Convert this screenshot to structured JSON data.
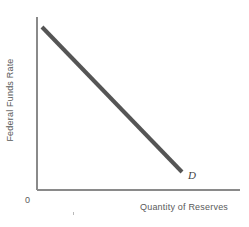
{
  "figure": {
    "background_color": "#ffffff",
    "width": 249,
    "height": 227
  },
  "axes": {
    "origin_label": "0",
    "axis_color": "#8a8a8a",
    "x_axis": {
      "start_x": 37,
      "end_x": 240,
      "y": 190
    },
    "y_axis": {
      "x": 37,
      "start_y": 17,
      "end_y": 190
    }
  },
  "labels": {
    "y_axis_title": "Federal Funds Rate",
    "x_axis_title": "Quantity of Reserves",
    "curve_label": "D",
    "text_color": "#5a5a5a"
  },
  "chart_data": {
    "type": "line",
    "title": "",
    "subtitle": "",
    "xlabel": "Quantity of Reserves",
    "ylabel": "Federal Funds Rate",
    "xlim": [
      0,
      1
    ],
    "ylim": [
      0,
      1
    ],
    "grid": false,
    "legend": "none",
    "axis_ticks": {
      "x": [],
      "y": []
    },
    "origin_tick_label": "0",
    "series": [
      {
        "name": "D",
        "label": "D",
        "description": "Downward-sloping demand curve for reserves",
        "color": "#555555",
        "linewidth": 4,
        "annotation": "D",
        "points": [
          {
            "x": 0.025,
            "y": 0.945
          },
          {
            "x": 0.715,
            "y": 0.105
          }
        ],
        "pixel_points": [
          {
            "x": 42,
            "y": 27
          },
          {
            "x": 182,
            "y": 172
          }
        ]
      }
    ],
    "annotations": [
      {
        "text": "D",
        "x": 190,
        "y": 177,
        "style": "italic"
      },
      {
        "text": "0",
        "x": 27,
        "y": 202,
        "style": "normal"
      }
    ]
  }
}
